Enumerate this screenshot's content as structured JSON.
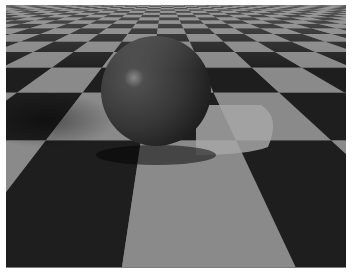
{
  "image": {
    "description": "Ray-traced render of a dark glossy sphere resting on a grey and black perspective checkerboard floor with a bright reflected highlight patch and soft shadows",
    "colors": {
      "light_tile": "#8a8a8a",
      "dark_tile": "#1e1e1e",
      "sphere": "#3c3c3c",
      "highlight": "#9a9a9a",
      "reflection_patch": "#a6a6a6",
      "border": "#ffffff"
    }
  }
}
